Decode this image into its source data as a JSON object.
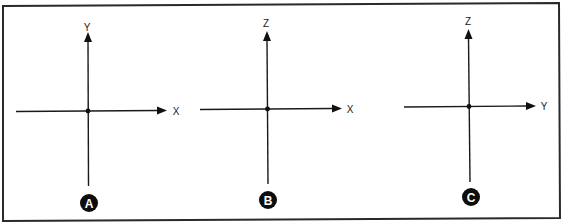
{
  "figure": {
    "frame_color": "#2a2a2a",
    "ink_color": "#111111",
    "background": "#ffffff"
  },
  "panels": [
    {
      "id": "A",
      "badge_label": "A",
      "vertical_axis_label": "Y",
      "horizontal_axis_label": "X",
      "origin": [
        88,
        111
      ],
      "horizontal": {
        "x_start": 16,
        "x_tip": 166,
        "y": 111
      },
      "vertical": {
        "x": 88,
        "y_tip": 33,
        "y_end": 186
      },
      "vertical_label_pos": [
        87,
        30
      ],
      "horizontal_label_pos": [
        176,
        115
      ],
      "badge_pos": [
        89,
        203
      ]
    },
    {
      "id": "B",
      "badge_label": "B",
      "vertical_axis_label": "Z",
      "horizontal_axis_label": "X",
      "origin": [
        267,
        109
      ],
      "horizontal": {
        "x_start": 200,
        "x_tip": 341,
        "y": 109
      },
      "vertical": {
        "x": 267,
        "y_tip": 31,
        "y_end": 184
      },
      "vertical_label_pos": [
        266,
        27
      ],
      "horizontal_label_pos": [
        350,
        113
      ],
      "badge_pos": [
        268,
        200
      ]
    },
    {
      "id": "C",
      "badge_label": "C",
      "vertical_axis_label": "Z",
      "horizontal_axis_label": "Y",
      "origin": [
        469,
        106
      ],
      "horizontal": {
        "x_start": 404,
        "x_tip": 535,
        "y": 106
      },
      "vertical": {
        "x": 469,
        "y_tip": 29,
        "y_end": 182
      },
      "vertical_label_pos": [
        468,
        25
      ],
      "horizontal_label_pos": [
        544,
        109
      ],
      "badge_pos": [
        471,
        197
      ]
    }
  ]
}
